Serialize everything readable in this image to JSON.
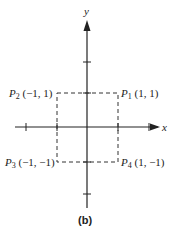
{
  "axes": {
    "x_label": "x",
    "y_label": "y",
    "color": "#222222"
  },
  "points": [
    {
      "name": "P",
      "sub": "1",
      "coords": "(1, 1)"
    },
    {
      "name": "P",
      "sub": "2",
      "coords": "(−1, 1)"
    },
    {
      "name": "P",
      "sub": "3",
      "coords": "(−1, −1)"
    },
    {
      "name": "P",
      "sub": "4",
      "coords": "(1, −1)"
    }
  ],
  "caption": "(b)"
}
